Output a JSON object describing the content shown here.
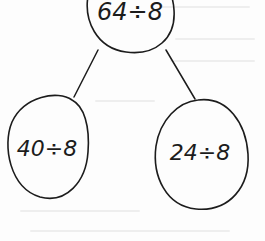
{
  "diagram": {
    "type": "number-bond",
    "whole": {
      "label": "64÷8"
    },
    "parts": [
      {
        "label": "40÷8"
      },
      {
        "label": "24÷8"
      }
    ],
    "colors": {
      "stroke": "#1c1c1c",
      "background": "#fdfdfd"
    }
  }
}
